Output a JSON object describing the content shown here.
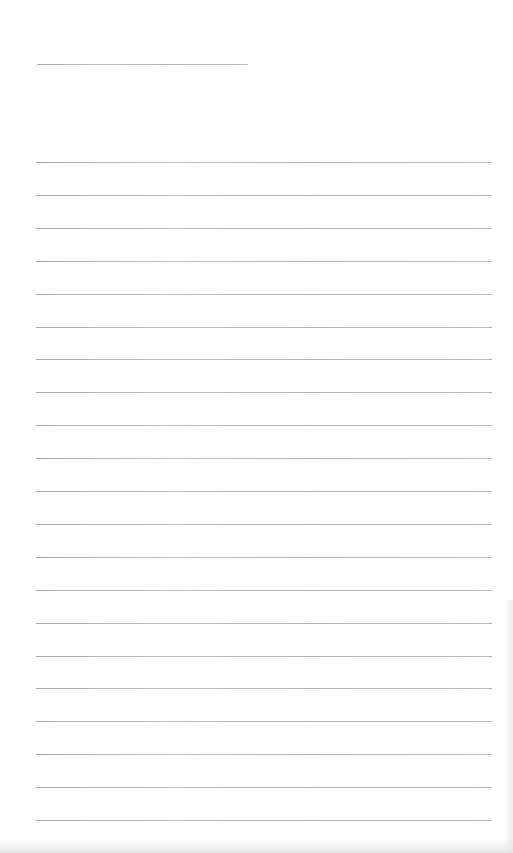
{
  "page": {
    "type": "lined paper",
    "background": "#fefefe",
    "rule_color": "#a8a8a8",
    "header_rule": {
      "x": 37,
      "y": 64,
      "width": 211
    },
    "body_rules": {
      "x": 36,
      "width": 456,
      "start_y": 162,
      "spacing": 32.9,
      "count": 21
    }
  }
}
